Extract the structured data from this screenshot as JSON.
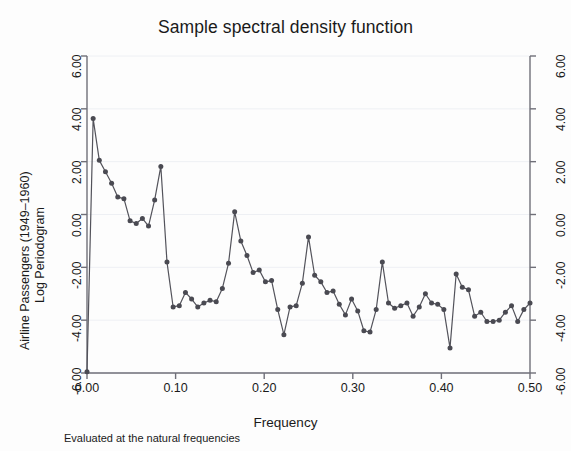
{
  "chart_data": {
    "type": "line",
    "title": "Sample spectral density function",
    "subtitle": "",
    "note": "Evaluated at the natural frequencies",
    "xlabel": "Frequency",
    "ylabel": "Airline Passengers (1949–1960) Log Periodogram",
    "ylabel_line1": "Airline Passengers (1949–1960)",
    "ylabel_line2": "Log Periodogram",
    "xlim": [
      0.0,
      0.5
    ],
    "ylim": [
      -6.0,
      6.0
    ],
    "xticks": [
      0.0,
      0.1,
      0.2,
      0.3,
      0.4,
      0.5
    ],
    "xticklabels": [
      "0.00",
      "0.10",
      "0.20",
      "0.30",
      "0.40",
      "0.50"
    ],
    "yticks": [
      -6.0,
      -4.0,
      -2.0,
      0.0,
      2.0,
      4.0,
      6.0
    ],
    "yticklabels": [
      "-6.00",
      "-4.00",
      "-2.00",
      "0.00",
      "2.00",
      "4.00",
      "6.00"
    ],
    "y_axis_mirrored": true,
    "grid": "horizontal-faint",
    "legend": "none",
    "marker": "circle",
    "marker_color": "#4a4a52",
    "line_color": "#53535b",
    "series": [
      {
        "name": "Log Periodogram",
        "x": [
          0.0,
          0.00694,
          0.01389,
          0.02083,
          0.02778,
          0.03472,
          0.04167,
          0.04861,
          0.05556,
          0.0625,
          0.06944,
          0.07639,
          0.08333,
          0.09028,
          0.09722,
          0.10417,
          0.11111,
          0.11806,
          0.125,
          0.13194,
          0.13889,
          0.14583,
          0.15278,
          0.15972,
          0.16667,
          0.17361,
          0.18056,
          0.1875,
          0.19444,
          0.20139,
          0.20833,
          0.21528,
          0.22222,
          0.22917,
          0.23611,
          0.24306,
          0.25,
          0.25694,
          0.26389,
          0.27083,
          0.27778,
          0.28472,
          0.29167,
          0.29861,
          0.30556,
          0.3125,
          0.31944,
          0.32639,
          0.33333,
          0.34028,
          0.34722,
          0.35417,
          0.36111,
          0.36806,
          0.375,
          0.38194,
          0.38889,
          0.39583,
          0.40278,
          0.40972,
          0.41667,
          0.42361,
          0.43056,
          0.4375,
          0.44444,
          0.45139,
          0.45833,
          0.46528,
          0.47222,
          0.47917,
          0.48611,
          0.49306,
          0.5
        ],
        "y": [
          -5.95,
          3.63,
          2.05,
          1.62,
          1.18,
          0.66,
          0.6,
          -0.24,
          -0.34,
          -0.15,
          -0.44,
          0.55,
          1.82,
          -1.8,
          -3.5,
          -3.45,
          -2.95,
          -3.2,
          -3.5,
          -3.35,
          -3.25,
          -3.3,
          -2.8,
          -1.85,
          0.1,
          -1.0,
          -1.55,
          -2.2,
          -2.1,
          -2.55,
          -2.5,
          -3.6,
          -4.55,
          -3.5,
          -3.45,
          -2.6,
          -0.85,
          -2.3,
          -2.55,
          -2.95,
          -2.9,
          -3.4,
          -3.8,
          -3.2,
          -3.65,
          -4.4,
          -4.45,
          -3.6,
          -1.8,
          -3.35,
          -3.55,
          -3.45,
          -3.35,
          -3.85,
          -3.5,
          -3.0,
          -3.35,
          -3.4,
          -3.6,
          -5.05,
          -2.25,
          -2.75,
          -2.85,
          -3.85,
          -3.7,
          -4.05,
          -4.05,
          -4.0,
          -3.7,
          -3.45,
          -4.05,
          -3.6,
          -3.35
        ]
      }
    ]
  }
}
